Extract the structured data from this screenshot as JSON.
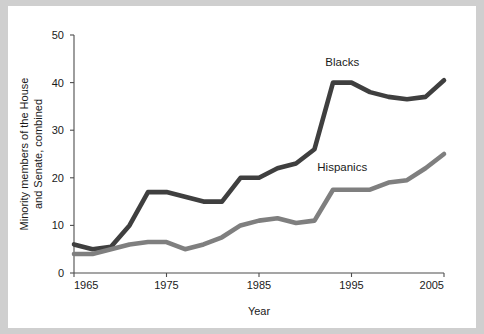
{
  "figure": {
    "background_color": "#ffffff",
    "page_background_color": "#cfcfcf"
  },
  "axes": {
    "x_title": "Year",
    "y_title_line1": "Minority members of the House",
    "y_title_line2": "and Senate, combined",
    "x_ticks": [
      "1965",
      "1975",
      "1985",
      "1995",
      "2005"
    ],
    "y_ticks": [
      "0",
      "10",
      "20",
      "30",
      "40",
      "50"
    ]
  },
  "series_labels": {
    "blacks": "Blacks",
    "hispanics": "Hispanics"
  },
  "chart_data": {
    "type": "line",
    "title": "",
    "xlabel": "Year",
    "ylabel": "Minority members of the House and Senate, combined",
    "xlim": [
      1965,
      2005
    ],
    "ylim": [
      0,
      50
    ],
    "xticks": [
      1965,
      1975,
      1985,
      1995,
      2005
    ],
    "yticks": [
      0,
      10,
      20,
      30,
      40,
      50
    ],
    "grid": false,
    "legend": "inline-labels",
    "x": [
      1965,
      1967,
      1969,
      1971,
      1973,
      1975,
      1977,
      1979,
      1981,
      1983,
      1985,
      1987,
      1989,
      1991,
      1993,
      1995,
      1997,
      1999,
      2001,
      2003,
      2005
    ],
    "series": [
      {
        "name": "Blacks",
        "color": "#3f3f3f",
        "label_position": {
          "x": 1994,
          "y": 43.5
        },
        "values": [
          6,
          5,
          5.5,
          10,
          17,
          17,
          16,
          15,
          15,
          20,
          20,
          22,
          23,
          26,
          40,
          40,
          38,
          37,
          36.5,
          37,
          40.5
        ]
      },
      {
        "name": "Hispanics",
        "color": "#7f7f7f",
        "label_position": {
          "x": 1994,
          "y": 21.5
        },
        "values": [
          4,
          4,
          5,
          6,
          6.5,
          6.5,
          5,
          6,
          7.5,
          10,
          11,
          11.5,
          10.5,
          11,
          17.5,
          17.5,
          17.5,
          19,
          19.5,
          22,
          25
        ]
      }
    ]
  }
}
